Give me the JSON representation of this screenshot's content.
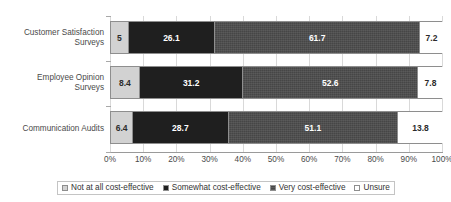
{
  "title": "Perceived cost-effectiveness",
  "chart_data": {
    "type": "bar",
    "orientation": "horizontal",
    "stacked": true,
    "stack_mode": "percent",
    "title": "Perceived cost-effectiveness",
    "xlabel": "",
    "ylabel": "",
    "xlim": [
      0,
      100
    ],
    "grid": true,
    "grid_axis": "x",
    "legend_position": "bottom",
    "categories": [
      "Customer Satisfaction Surveys",
      "Employee Opinion Surveys",
      "Communication Audits"
    ],
    "series": [
      {
        "name": "Not at all cost-effective",
        "color": "#d2d2d2",
        "values": [
          5,
          8.4,
          6.4
        ],
        "labels": [
          "5",
          "8.4",
          "6.4"
        ]
      },
      {
        "name": "Somewhat cost-effective",
        "color": "#1f1f1f",
        "values": [
          26.1,
          31.2,
          28.7
        ],
        "labels": [
          "26.1",
          "31.2",
          "28.7"
        ]
      },
      {
        "name": "Very cost-effective",
        "color": "#4d4d4d",
        "values": [
          61.7,
          52.6,
          51.1
        ],
        "labels": [
          "61.7",
          "52.6",
          "51.1"
        ]
      },
      {
        "name": "Unsure",
        "color": "#ffffff",
        "values": [
          7.2,
          7.8,
          13.8
        ],
        "labels": [
          "7.2",
          "7.8",
          "13.8"
        ]
      }
    ],
    "xticks": [
      0,
      10,
      20,
      30,
      40,
      50,
      60,
      70,
      80,
      90,
      100
    ],
    "xticklabels": [
      "0%",
      "10%",
      "20%",
      "30%",
      "40%",
      "50%",
      "60%",
      "70%",
      "80%",
      "90%",
      "100%"
    ]
  },
  "axis": {
    "x_tick_labels": [
      "0%",
      "10%",
      "20%",
      "30%",
      "40%",
      "50%",
      "60%",
      "70%",
      "80%",
      "90%",
      "100%"
    ],
    "category_labels": [
      "Customer Satisfaction Surveys",
      "Employee Opinion Surveys",
      "Communication Audits"
    ]
  },
  "legend": {
    "items": [
      {
        "label": "Not at all cost-effective",
        "color": "#d2d2d2"
      },
      {
        "label": "Somewhat cost-effective",
        "color": "#1f1f1f"
      },
      {
        "label": "Very cost-effective",
        "color": "#4d4d4d"
      },
      {
        "label": "Unsure",
        "color": "#ffffff"
      }
    ]
  }
}
